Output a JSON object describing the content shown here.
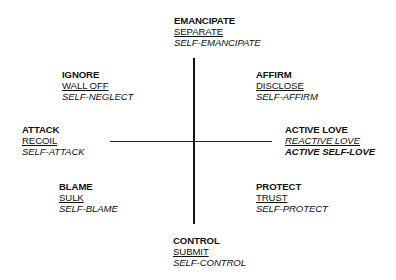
{
  "diagram": {
    "axes": {
      "vertical": {
        "from": "EMANCIPATE",
        "to": "CONTROL"
      },
      "horizontal": {
        "from": "ATTACK",
        "to": "ACTIVE LOVE"
      }
    },
    "nodes": {
      "emancipate": {
        "primary": "EMANCIPATE",
        "reactive": "SEPARATE",
        "self": "SELF-EMANCIPATE"
      },
      "ignore": {
        "primary": "IGNORE",
        "reactive": "WALL OFF",
        "self": "SELF-NEGLECT"
      },
      "affirm": {
        "primary": "AFFIRM",
        "reactive": "DISCLOSE",
        "self": "SELF-AFFIRM"
      },
      "attack": {
        "primary": "ATTACK",
        "reactive": "RECOIL",
        "self": "SELF-ATTACK"
      },
      "active_love": {
        "primary": "ACTIVE LOVE",
        "reactive": "REACTIVE LOVE",
        "self": "ACTIVE SELF-LOVE"
      },
      "blame": {
        "primary": "BLAME",
        "reactive": "SULK",
        "self": "SELF-BLAME"
      },
      "protect": {
        "primary": "PROTECT",
        "reactive": "TRUST",
        "self": "SELF-PROTECT"
      },
      "control": {
        "primary": "CONTROL",
        "reactive": "SUBMIT",
        "self": "SELF-CONTROL"
      }
    }
  }
}
